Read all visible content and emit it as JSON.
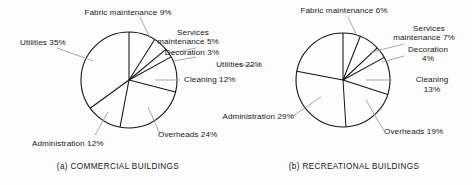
{
  "figure": {
    "background_color": "#fdfdfd",
    "stroke_color": "#141414",
    "leader_color": "#8a8a8a"
  },
  "charts": [
    {
      "id": "commercial",
      "caption": "(a) COMMERCIAL BUILDINGS",
      "labels": {
        "fabric": "Fabric maintenance 9%",
        "services_line1": "Services",
        "services_line2": "maintenance 5%",
        "decoration": "Decoration 3%",
        "cleaning": "Cleaning 12%",
        "overheads": "Overheads 24%",
        "administration": "Administration 12%",
        "utilities": "Utilities 35%"
      }
    },
    {
      "id": "recreational",
      "caption": "(b) RECREATIONAL BUILDINGS",
      "labels": {
        "fabric": "Fabric maintenance 6%",
        "services_line1": "Services",
        "services_line2": "maintenance 7%",
        "decoration_line1": "Decoration",
        "decoration_line2": "4%",
        "cleaning_line1": "Cleaning",
        "cleaning_line2": "13%",
        "overheads": "Overheads 19%",
        "administration": "Administration 29%",
        "utilities": "Utilities 22%"
      }
    }
  ],
  "chart_data": [
    {
      "type": "pie",
      "title": "(a) COMMERCIAL BUILDINGS",
      "xlabel": "",
      "ylabel": "",
      "legend": "none",
      "grid": false,
      "units": "percent",
      "start_angle_deg": 0,
      "direction": "clockwise",
      "categories": [
        "Fabric maintenance",
        "Services maintenance",
        "Decoration",
        "Cleaning",
        "Overheads",
        "Administration",
        "Utilities"
      ],
      "values": [
        9,
        5,
        3,
        12,
        24,
        12,
        35
      ],
      "labels": [
        "Fabric maintenance 9%",
        "Services maintenance 5%",
        "Decoration 3%",
        "Cleaning 12%",
        "Overheads 24%",
        "Administration 12%",
        "Utilities 35%"
      ]
    },
    {
      "type": "pie",
      "title": "(b) RECREATIONAL BUILDINGS",
      "xlabel": "",
      "ylabel": "",
      "legend": "none",
      "grid": false,
      "units": "percent",
      "start_angle_deg": 0,
      "direction": "clockwise",
      "categories": [
        "Fabric maintenance",
        "Services maintenance",
        "Decoration",
        "Cleaning",
        "Overheads",
        "Administration",
        "Utilities"
      ],
      "values": [
        6,
        7,
        4,
        13,
        19,
        29,
        22
      ],
      "labels": [
        "Fabric maintenance 6%",
        "Services maintenance 7%",
        "Decoration 4%",
        "Cleaning 13%",
        "Overheads 19%",
        "Administration 29%",
        "Utilities 22%"
      ]
    }
  ]
}
